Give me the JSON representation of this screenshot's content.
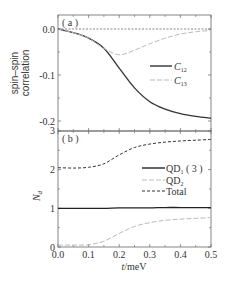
{
  "chart_data": [
    {
      "type": "line",
      "panel": "(a)",
      "title": "",
      "xlabel": "t/meV",
      "ylabel": "spin-spin correlation",
      "xlim": [
        0.0,
        0.5
      ],
      "ylim": [
        -0.22,
        0.03
      ],
      "yticks": [
        "0.0",
        "-0.1",
        "-0.2"
      ],
      "grid": false,
      "legend_position": "center-right",
      "x": [
        0.0,
        0.05,
        0.1,
        0.15,
        0.2,
        0.25,
        0.3,
        0.35,
        0.4,
        0.45,
        0.5
      ],
      "series": [
        {
          "name": "C12",
          "style": "solid",
          "color": "#333333",
          "values": [
            0.0,
            -0.008,
            -0.02,
            -0.042,
            -0.085,
            -0.128,
            -0.158,
            -0.174,
            -0.184,
            -0.19,
            -0.194
          ]
        },
        {
          "name": "C13",
          "style": "dashed",
          "color": "#bbbbbb",
          "values": [
            0.0,
            -0.008,
            -0.02,
            -0.042,
            -0.056,
            -0.046,
            -0.032,
            -0.02,
            -0.011,
            -0.006,
            -0.003
          ]
        },
        {
          "name": "zero",
          "style": "dotted",
          "color": "#666666",
          "values": [
            0,
            0,
            0,
            0,
            0,
            0,
            0,
            0,
            0,
            0,
            0
          ]
        }
      ]
    },
    {
      "type": "line",
      "panel": "(b)",
      "title": "",
      "xlabel": "t/meV",
      "ylabel": "N_d",
      "xlim": [
        0.0,
        0.5
      ],
      "ylim": [
        0,
        3
      ],
      "xticks": [
        "0.0",
        "0.1",
        "0.2",
        "0.3",
        "0.4",
        "0.5"
      ],
      "yticks": [
        "0",
        "1",
        "2",
        "3"
      ],
      "grid": false,
      "legend_position": "center-right",
      "x": [
        0.0,
        0.05,
        0.1,
        0.15,
        0.2,
        0.25,
        0.3,
        0.35,
        0.4,
        0.45,
        0.5
      ],
      "series": [
        {
          "name": "QD1 (3)",
          "style": "solid",
          "color": "#222222",
          "values": [
            1.0,
            1.0,
            1.0,
            1.0,
            1.01,
            1.01,
            1.01,
            1.02,
            1.02,
            1.02,
            1.02
          ]
        },
        {
          "name": "QD2",
          "style": "dashed",
          "color": "#bbbbbb",
          "values": [
            0.05,
            0.05,
            0.06,
            0.15,
            0.35,
            0.53,
            0.63,
            0.69,
            0.72,
            0.74,
            0.76
          ]
        },
        {
          "name": "Total",
          "style": "short-dashed",
          "color": "#333333",
          "values": [
            2.05,
            2.04,
            2.06,
            2.15,
            2.38,
            2.57,
            2.66,
            2.71,
            2.74,
            2.76,
            2.78
          ]
        }
      ]
    }
  ],
  "labels": {
    "panel_a": "( a )",
    "panel_b": "( b )",
    "ylabel_a_line1": "spin–spin",
    "ylabel_a_line2": "correlation",
    "ylabel_b": "N",
    "ylabel_b_sub": "d",
    "xlabel_italic": "t",
    "xlabel_rest": "/meV",
    "legend_a": [
      {
        "main": "C",
        "sub": "12"
      },
      {
        "main": "C",
        "sub": "13"
      }
    ],
    "legend_b": [
      {
        "main": "QD",
        "sub": "1",
        "suffix": " ( 3 )"
      },
      {
        "main": "QD",
        "sub": "2",
        "suffix": ""
      },
      {
        "main": "Total",
        "sub": "",
        "suffix": ""
      }
    ],
    "yticks_a": [
      "0.0",
      "-0.1",
      "-0.2"
    ],
    "yticks_b": [
      "3",
      "2",
      "1",
      "0"
    ],
    "xticks": [
      "0.0",
      "0.1",
      "0.2",
      "0.3",
      "0.4",
      "0.5"
    ]
  }
}
